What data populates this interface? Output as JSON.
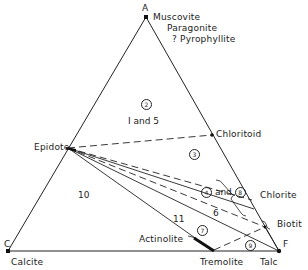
{
  "diagram": {
    "type": "ternary-phase-diagram",
    "vertices": {
      "top": {
        "letter": "A",
        "minerals": [
          "Muscovite",
          "Paragonite",
          "? Pyrophyllite"
        ]
      },
      "left": {
        "letter": "C",
        "mineral": "Calcite"
      },
      "right": {
        "letter": "F",
        "mineral": "Talc"
      }
    },
    "phases": {
      "epidote": "Epidote",
      "chloritoid": "Chloritoid",
      "chlorite": "Chlorite",
      "biotite": "Biotit",
      "actinolite": "Actinolite",
      "tremolite": "Tremolite"
    },
    "fields": {
      "f2": "2",
      "f1and5": "I and 5",
      "f3": "3",
      "f4": "4",
      "and": "and",
      "f8": "8",
      "f6": "6",
      "f7": "7",
      "f9": "9",
      "f10": "10",
      "f11": "11"
    },
    "colors": {
      "line": "#222222",
      "background": "#ffffff"
    }
  }
}
